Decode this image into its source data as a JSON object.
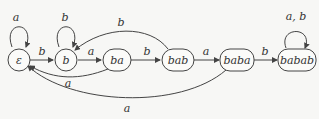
{
  "diagram": {
    "type": "finite-automaton",
    "states": [
      {
        "id": "eps",
        "label": "ε"
      },
      {
        "id": "b",
        "label": "b"
      },
      {
        "id": "ba",
        "label": "ba"
      },
      {
        "id": "bab",
        "label": "bab"
      },
      {
        "id": "baba",
        "label": "baba"
      },
      {
        "id": "babab",
        "label": "babab"
      }
    ],
    "transitions": [
      {
        "from": "eps",
        "to": "eps",
        "label": "a"
      },
      {
        "from": "eps",
        "to": "b",
        "label": "b"
      },
      {
        "from": "b",
        "to": "b",
        "label": "b"
      },
      {
        "from": "b",
        "to": "ba",
        "label": "a"
      },
      {
        "from": "ba",
        "to": "bab",
        "label": "b"
      },
      {
        "from": "ba",
        "to": "eps",
        "label": "a"
      },
      {
        "from": "bab",
        "to": "b",
        "label": "b"
      },
      {
        "from": "bab",
        "to": "baba",
        "label": "a"
      },
      {
        "from": "baba",
        "to": "eps",
        "label": "a"
      },
      {
        "from": "baba",
        "to": "babab",
        "label": "b"
      },
      {
        "from": "babab",
        "to": "babab",
        "label": "a, b"
      }
    ]
  }
}
